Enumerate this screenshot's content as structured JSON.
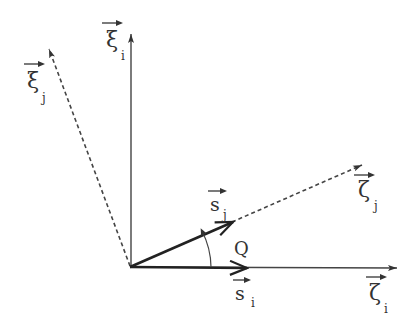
{
  "diagram": {
    "colors": {
      "line": "#333333",
      "background": "#ffffff"
    },
    "vectors": {
      "xi_i": {
        "symbol": "ξ",
        "subscript": "i",
        "style": "solid"
      },
      "xi_j": {
        "symbol": "ξ",
        "subscript": "j",
        "style": "dashed"
      },
      "zeta_i": {
        "symbol": "ζ",
        "subscript": "i",
        "style": "solid"
      },
      "zeta_j": {
        "symbol": "ζ",
        "subscript": "j",
        "style": "dashed"
      },
      "s_i": {
        "symbol": "s",
        "subscript": "i",
        "style": "bold"
      },
      "s_j": {
        "symbol": "s",
        "subscript": "j",
        "style": "bold"
      }
    },
    "angle_label": "Q"
  }
}
